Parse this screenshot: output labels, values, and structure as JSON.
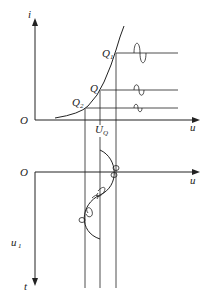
{
  "diagram": {
    "type": "diode-characteristic-small-signal",
    "upper_plot": {
      "y_axis_label": "i",
      "x_axis_label": "u",
      "origin_label": "O",
      "points": [
        {
          "label": "Q",
          "subscript": "1"
        },
        {
          "label": "Q",
          "subscript": ""
        },
        {
          "label": "Q",
          "subscript": "2"
        }
      ],
      "x_marker": {
        "label": "U",
        "subscript": "Q"
      }
    },
    "lower_plot": {
      "origin_label": "O",
      "x_axis_label": "u",
      "y_axis_label": "t",
      "signal_label": {
        "label": "u",
        "subscript": "1"
      }
    },
    "colors": {
      "stroke": "#222222",
      "background": "#ffffff"
    }
  }
}
